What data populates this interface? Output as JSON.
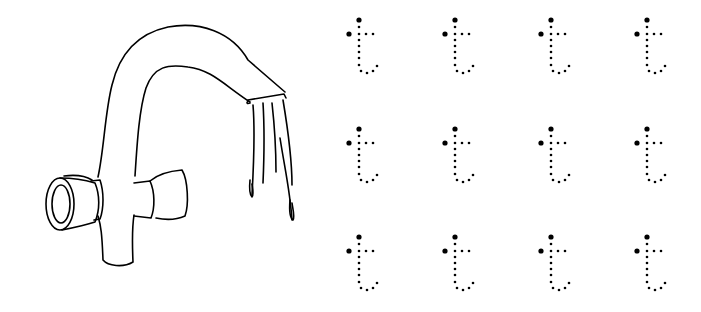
{
  "worksheet": {
    "title": "Letter t tracing worksheet",
    "letter": "t",
    "picture": "faucet-with-running-water",
    "rows": 3,
    "columns": 4,
    "ink_color": "#000000",
    "background_color": "#ffffff"
  },
  "letters": [
    {
      "row": 0,
      "col": 0,
      "x": 359,
      "y": 20
    },
    {
      "row": 0,
      "col": 1,
      "x": 455,
      "y": 20
    },
    {
      "row": 0,
      "col": 2,
      "x": 551,
      "y": 20
    },
    {
      "row": 0,
      "col": 3,
      "x": 647,
      "y": 20
    },
    {
      "row": 1,
      "col": 0,
      "x": 359,
      "y": 129
    },
    {
      "row": 1,
      "col": 1,
      "x": 455,
      "y": 129
    },
    {
      "row": 1,
      "col": 2,
      "x": 551,
      "y": 129
    },
    {
      "row": 1,
      "col": 3,
      "x": 647,
      "y": 129
    },
    {
      "row": 2,
      "col": 0,
      "x": 359,
      "y": 237
    },
    {
      "row": 2,
      "col": 1,
      "x": 455,
      "y": 237
    },
    {
      "row": 2,
      "col": 2,
      "x": 551,
      "y": 237
    },
    {
      "row": 2,
      "col": 3,
      "x": 647,
      "y": 237
    }
  ]
}
